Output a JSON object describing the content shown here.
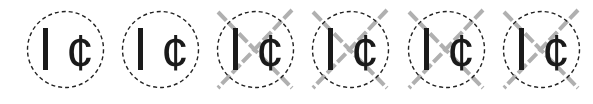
{
  "symbols": [
    {
      "id": 1,
      "label_left": "I",
      "label_right": "¢",
      "crossed": false,
      "center_x": 65
    },
    {
      "id": 2,
      "label_left": "I",
      "label_right": "¢",
      "crossed": false,
      "center_x": 160
    },
    {
      "id": 3,
      "label_left": "I",
      "label_right": "¢",
      "crossed": true,
      "center_x": 255
    },
    {
      "id": 4,
      "label_left": "I",
      "label_right": "¢",
      "crossed": true,
      "center_x": 350
    },
    {
      "id": 5,
      "label_left": "I",
      "label_right": "¢",
      "crossed": true,
      "center_x": 446
    },
    {
      "id": 6,
      "label_left": "I",
      "label_right": "¢",
      "crossed": true,
      "center_x": 541
    }
  ],
  "colors": {
    "background": "#ffffff",
    "glyph": "#1a1a1a",
    "circle_outline": "#222222",
    "cross_lines": "#b0b0b0"
  }
}
